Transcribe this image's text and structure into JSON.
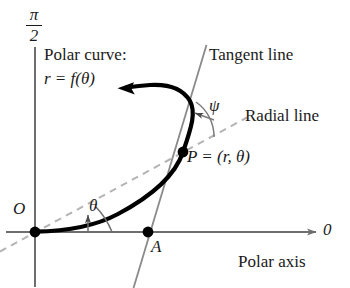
{
  "figure": {
    "background_color": "#ffffff",
    "axis_color": "#6e6e6e",
    "curve_color": "#000000",
    "dash_color": "#b4b4b4",
    "text_color": "#1a1a1a"
  },
  "labels": {
    "pi_numerator": "π",
    "pi_denominator": "2",
    "polar_curve": "Polar curve:",
    "curve_equation": "r = f(θ)",
    "tangent_line": "Tangent line",
    "psi": "ψ",
    "radial_line": "Radial line",
    "point_p": "P = (r, θ)",
    "origin": "O",
    "theta": "θ",
    "point_a": "A",
    "axis_zero": "0",
    "polar_axis": "Polar axis"
  },
  "geometry": {
    "origin_point": {
      "x": 35,
      "y": 232
    },
    "point_p": {
      "x": 183,
      "y": 152
    },
    "point_a": {
      "x": 148,
      "y": 232
    },
    "vertical_axis": {
      "x": 35,
      "y_top": 47,
      "y_bottom": 286
    },
    "polar_axis": {
      "y": 232,
      "x_start": 6,
      "x_end": 318
    },
    "tangent_line": {
      "x1": 206,
      "y1": 46,
      "x2": 134,
      "y2": 288
    },
    "radial_line": {
      "x1": 0,
      "y1": 251,
      "x2": 246,
      "y2": 118
    },
    "curve_arrow_tip": {
      "x": 119,
      "y": 88
    }
  }
}
